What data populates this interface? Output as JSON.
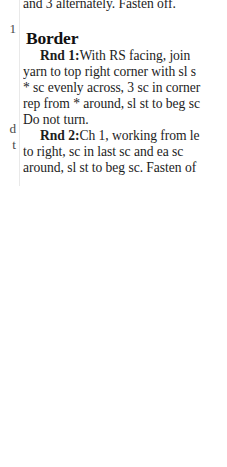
{
  "document": {
    "type": "scanned-book-page-fragment",
    "background_color": "#ffffff",
    "text_color": "#1d1d1d",
    "gutter_fragments": {
      "fragment_1": "1",
      "fragment_2": "d",
      "fragment_3": "t"
    },
    "column": {
      "continued_line": "and 3 alternately. Fasten off.",
      "heading": "Border",
      "paragraphs": [
        {
          "label": "Rnd 1:",
          "lines": [
            "With RS facing, join",
            "yarn to top right corner with sl s",
            "* sc evenly across, 3 sc in corner",
            "rep from * around, sl st to beg sc",
            "Do not turn."
          ]
        },
        {
          "label": "Rnd 2:",
          "lines": [
            "Ch 1, working from le",
            "to right, sc in last sc and ea sc",
            "around, sl st to beg sc. Fasten of"
          ]
        }
      ]
    }
  }
}
